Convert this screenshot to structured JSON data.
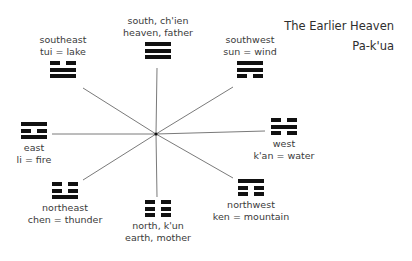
{
  "title": {
    "line1": "The Earlier Heaven",
    "line2": "Pa-k'ua"
  },
  "center": {
    "x": 156,
    "y": 134
  },
  "colors": {
    "spoke": "#7a7a7a",
    "trigram": "#111111",
    "text": "#3a3a3a"
  },
  "nodes": {
    "south": {
      "line1": "south, ch'ien",
      "line2": "heaven, father",
      "lines": [
        "yang",
        "yang",
        "yang"
      ]
    },
    "southeast": {
      "line1": "southeast",
      "line2": "tui = lake",
      "lines": [
        "yin",
        "yang",
        "yang"
      ]
    },
    "southwest": {
      "line1": "southwest",
      "line2": "sun = wind",
      "lines": [
        "yang",
        "yang",
        "yin"
      ]
    },
    "east": {
      "line1": "east",
      "line2": "li = fire",
      "lines": [
        "yang",
        "yin",
        "yang"
      ]
    },
    "west": {
      "line1": "west",
      "line2": "k'an = water",
      "lines": [
        "yin",
        "yang",
        "yin"
      ]
    },
    "northeast": {
      "line1": "northeast",
      "line2": "chen = thunder",
      "lines": [
        "yin",
        "yin",
        "yang"
      ]
    },
    "north": {
      "line1": "north, k'un",
      "line2": "earth, mother",
      "lines": [
        "yin",
        "yin",
        "yin"
      ]
    },
    "northwest": {
      "line1": "northwest",
      "line2": "ken = mountain",
      "lines": [
        "yang",
        "yin",
        "yin"
      ]
    }
  }
}
